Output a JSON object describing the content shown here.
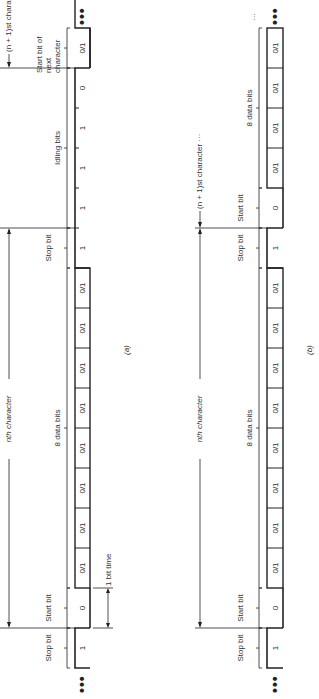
{
  "diagram_a": {
    "caption": "(a)",
    "character_label": "nth character",
    "next_character_label": "(n + 1)st character",
    "one_bit_time_label": "1 bit time",
    "groups": {
      "stop_bit_left": "Stop bit",
      "start_bit": "Start bit",
      "data_bits": "8 data bits",
      "stop_bit": "Stop bit",
      "idling_bits": "Idling bits",
      "start_bit_next": "Start bit of next character"
    },
    "cells": [
      "1",
      "0",
      "0/1",
      "0/1",
      "0/1",
      "0/1",
      "0/1",
      "0/1",
      "0/1",
      "0/1",
      "1",
      "1",
      "1",
      "1",
      "0",
      "0/1"
    ],
    "ellipsis": "•••"
  },
  "diagram_b": {
    "caption": "(b)",
    "character_label": "nth character",
    "next_character_label": "(n + 1)st character ···",
    "groups": {
      "stop_bit_left": "Stop bit",
      "start_bit": "Start bit",
      "data_bits": "8 data bits",
      "stop_bit": "Stop bit",
      "start_bit_next": "Start bit",
      "data_bits_next": "8 data bits"
    },
    "trailing_ellipsis": "···",
    "cells": [
      "1",
      "0",
      "0/1",
      "0/1",
      "0/1",
      "0/1",
      "0/1",
      "0/1",
      "0/1",
      "0/1",
      "1",
      "0",
      "0/1",
      "0/1",
      "0/1",
      "0/1"
    ],
    "ellipsis": "•••"
  }
}
